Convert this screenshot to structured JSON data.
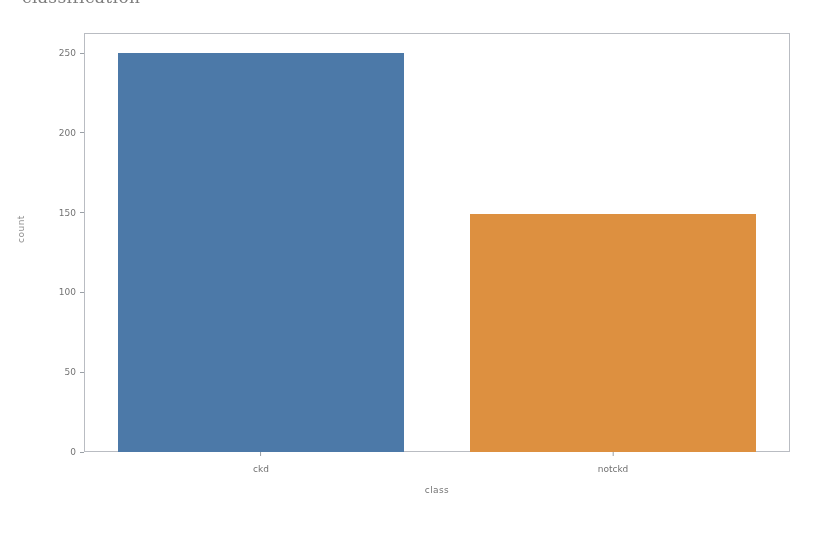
{
  "clipped_heading": "classification",
  "chart_data": {
    "type": "bar",
    "title": "",
    "xlabel": "class",
    "ylabel": "count",
    "categories": [
      "ckd",
      "notckd"
    ],
    "values": [
      250,
      149
    ],
    "series": [
      {
        "name": "count",
        "values": [
          250,
          149
        ]
      }
    ],
    "colors": [
      "#4c79a8",
      "#dd9040"
    ],
    "ylim": [
      0,
      262
    ],
    "yticks": [
      0,
      50,
      100,
      150,
      200,
      250
    ],
    "ytick_labels": [
      "0",
      "50",
      "100",
      "150",
      "200",
      "250"
    ],
    "xtick_labels": [
      "ckd",
      "notckd"
    ],
    "grid": false,
    "legend": "none",
    "frame": true,
    "background": "#ffffff",
    "frame_color": "#b9bcc2"
  }
}
